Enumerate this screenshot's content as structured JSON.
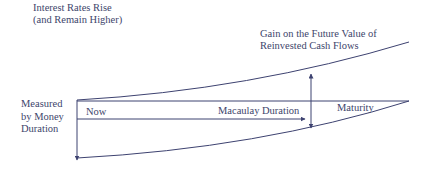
{
  "diagram": {
    "title_line1": "Interest Rates Rise",
    "title_line2": "(and Remain Higher)",
    "gain_line1": "Gain on the Future Value of",
    "gain_line2": "Reinvested Cash Flows",
    "measured_line1": "Measured",
    "measured_line2": "by Money",
    "measured_line3": "Duration",
    "now": "Now",
    "macaulay": "Macaulay Duration",
    "maturity": "Maturity",
    "colors": {
      "line": "#3d4270",
      "text": "#40456b",
      "background": "#ffffff"
    }
  }
}
